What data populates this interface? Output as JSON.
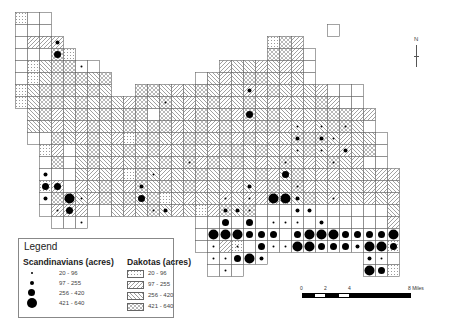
{
  "map": {
    "cell": 12,
    "origin_x": 15,
    "origin_y": 12,
    "patterns": {
      "o": "outline",
      "s": "stipple (Dakotas 20-96)",
      "d": "diagonal (Dakotas 97-255)",
      "b": "back-diagonal (Dakotas 256-420)",
      "x": "crosshatch (Dakotas 421-640)"
    },
    "rows": [
      "soo.............................",
      "ooo.......................o.....",
      "oddd.................sxd........",
      "oooxs................xxdo.......",
      "osbxxoo..........dbbdbddo.......",
      "osbxxxbx.......obdbxxbdbo.......",
      "sbxxxbxb..xxbdbxbdbddxbdbdooo...",
      "sbxxbxbxbdxbxbdbxdbxbddbbxdoo...",
      ".bxdbxbxbxxoxbdxbxdxbxbdbxxxdd..",
      ".bbdbdxbbxbxxdbxdxbdxxdbdbxxbo..",
      ".ooxbdxbdsxxbdxxbxdxbdbxxxbdbbo.",
      "..sdobxbbxbxdbxbdxxbxbdbxbddbxo.",
      "..oxobxbdbxbxbxdxbxbdbxbdbxbdoo.",
      "..ooobdbdsxbdbbxbxdbxdbxbddbbbdd",
      "..sdodbxbdxbxbxdbbdbdxbxdbbbbddb",
      "..oxdbdxbxbxsbdbbdbdddbbxbdbbdbd",
      "..odddoobdbxbdbsdxbxooooooooooob",
      "...ooo.........ooooooooooooooood",
      "...............ooooooooooooooooo",
      "...............oodsoooooooooooos",
      "................ooooo........ooo",
      "................ooo..........oos"
    ],
    "dots": [
      "00000000000000000000000000000000",
      "00010000000000000000000000000000",
      "00020000000000000000000000000000",
      "00030000000000000000000000000000",
      "00000100000000000000000000000000",
      "00000000000000000000000000000000",
      "00000000000000000002000000000000",
      "00000000000010000000000000000000",
      "00000000000000000003000000000000",
      "00000000000000000000000101010000",
      "00000000000000000000000202100000",
      "00000000000000000000000101020000",
      "00000000000000100000001000100000",
      "00200000000100000000003000000000",
      "00330000002000000002000100000000",
      "00204100003000000101044200100000",
      "00013000000120000221000220000000",
      "00100100000000000303011102000000",
      "00000000000000004443330344433334",
      "00000000000000001010311443332443",
      "00000000000000001134230044010210",
      "00000000000000000101000000212430"
    ]
  },
  "legend": {
    "title": "Legend",
    "scandinavians_header": "Scandinavians (acres)",
    "dakotas_header": "Dakotas (acres)",
    "scandinavians": [
      {
        "label": "20 - 96",
        "size": 2
      },
      {
        "label": "97 - 255",
        "size": 4
      },
      {
        "label": "256 - 420",
        "size": 7
      },
      {
        "label": "421 - 640",
        "size": 10
      }
    ],
    "dakotas": [
      {
        "label": "20 - 96",
        "pattern": "stipple"
      },
      {
        "label": "97 - 255",
        "pattern": "diagonal"
      },
      {
        "label": "256 - 420",
        "pattern": "back-diagonal"
      },
      {
        "label": "421 - 640",
        "pattern": "crosshatch"
      }
    ]
  },
  "scale_bar": {
    "ticks": [
      "0",
      "2",
      "4",
      "8 Miles"
    ]
  },
  "north_arrow": {
    "label": "N"
  }
}
